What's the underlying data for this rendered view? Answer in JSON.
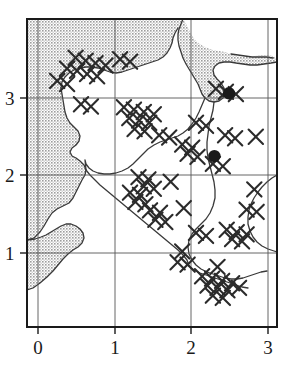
{
  "figure": {
    "kind": "distribution-map",
    "background_color": "#ffffff",
    "frame_color": "#1a1a1a",
    "grid_color": "#555555",
    "sea_fill_color": "#c9c9c9",
    "land_fill_color": "#ffffff",
    "coastline_color": "#3a3a3a",
    "marker_color": "#2b2b2b",
    "dot_color": "#1a1a1a"
  },
  "axes": {
    "x": {
      "tick_labels": [
        "0",
        "1",
        "2",
        "3"
      ],
      "tick_values": [
        0,
        1,
        2,
        3
      ],
      "range": [
        -0.16,
        3.13
      ],
      "label": ""
    },
    "y": {
      "tick_labels": [
        "1",
        "2",
        "3"
      ],
      "tick_values": [
        1,
        2,
        3
      ],
      "range": [
        0.04,
        3.77
      ],
      "label": ""
    }
  },
  "chart_data": {
    "type": "scatter",
    "title": "",
    "xlabel": "",
    "ylabel": "",
    "xlim": [
      -0.16,
      3.13
    ],
    "ylim": [
      0.04,
      3.77
    ],
    "grid": true,
    "legend": "none",
    "series": [
      {
        "name": "cross-records",
        "marker": "x",
        "color": "#2b2b2b",
        "points": [
          [
            0.49,
            3.52
          ],
          [
            0.62,
            3.48
          ],
          [
            0.75,
            3.45
          ],
          [
            0.88,
            3.42
          ],
          [
            0.38,
            3.38
          ],
          [
            0.51,
            3.35
          ],
          [
            0.64,
            3.31
          ],
          [
            0.77,
            3.28
          ],
          [
            1.07,
            3.5
          ],
          [
            1.2,
            3.47
          ],
          [
            0.25,
            3.22
          ],
          [
            0.38,
            3.18
          ],
          [
            2.32,
            3.12
          ],
          [
            2.45,
            3.08
          ],
          [
            2.58,
            3.05
          ],
          [
            0.56,
            2.92
          ],
          [
            0.69,
            2.89
          ],
          [
            1.12,
            2.88
          ],
          [
            1.25,
            2.85
          ],
          [
            1.38,
            2.82
          ],
          [
            1.51,
            2.79
          ],
          [
            1.19,
            2.74
          ],
          [
            1.32,
            2.71
          ],
          [
            1.45,
            2.68
          ],
          [
            1.26,
            2.6
          ],
          [
            1.39,
            2.57
          ],
          [
            1.58,
            2.52
          ],
          [
            1.71,
            2.49
          ],
          [
            2.06,
            2.68
          ],
          [
            2.19,
            2.64
          ],
          [
            2.44,
            2.52
          ],
          [
            2.57,
            2.48
          ],
          [
            2.84,
            2.5
          ],
          [
            1.88,
            2.4
          ],
          [
            2.01,
            2.36
          ],
          [
            1.95,
            2.28
          ],
          [
            2.08,
            2.24
          ],
          [
            2.28,
            2.15
          ],
          [
            2.41,
            2.12
          ],
          [
            1.31,
            1.98
          ],
          [
            1.44,
            1.95
          ],
          [
            1.38,
            1.86
          ],
          [
            1.51,
            1.83
          ],
          [
            1.73,
            1.92
          ],
          [
            1.2,
            1.78
          ],
          [
            1.33,
            1.75
          ],
          [
            1.27,
            1.66
          ],
          [
            1.4,
            1.63
          ],
          [
            1.46,
            1.55
          ],
          [
            1.59,
            1.52
          ],
          [
            1.53,
            1.43
          ],
          [
            1.66,
            1.4
          ],
          [
            1.9,
            1.58
          ],
          [
            2.82,
            1.82
          ],
          [
            2.72,
            1.56
          ],
          [
            2.85,
            1.53
          ],
          [
            2.06,
            1.26
          ],
          [
            2.19,
            1.22
          ],
          [
            2.46,
            1.3
          ],
          [
            2.59,
            1.27
          ],
          [
            2.72,
            1.24
          ],
          [
            2.53,
            1.18
          ],
          [
            2.66,
            1.15
          ],
          [
            1.88,
            1.02
          ],
          [
            1.82,
            0.88
          ],
          [
            1.95,
            0.85
          ],
          [
            2.34,
            0.82
          ],
          [
            2.14,
            0.7
          ],
          [
            2.27,
            0.67
          ],
          [
            2.4,
            0.64
          ],
          [
            2.53,
            0.61
          ],
          [
            2.21,
            0.58
          ],
          [
            2.34,
            0.55
          ],
          [
            2.47,
            0.52
          ],
          [
            2.28,
            0.45
          ],
          [
            2.41,
            0.42
          ],
          [
            2.62,
            0.55
          ]
        ]
      },
      {
        "name": "filled-circle-records",
        "marker": "filled-circle",
        "color": "#1a1a1a",
        "points": [
          [
            2.49,
            3.06
          ],
          [
            2.3,
            2.25
          ]
        ]
      }
    ]
  },
  "regions": {
    "sea": {
      "name": "sea-shaded-area",
      "fill": "#c9c9c9",
      "pattern": "stipple"
    },
    "land": {
      "name": "land-area",
      "fill": "#ffffff"
    }
  }
}
